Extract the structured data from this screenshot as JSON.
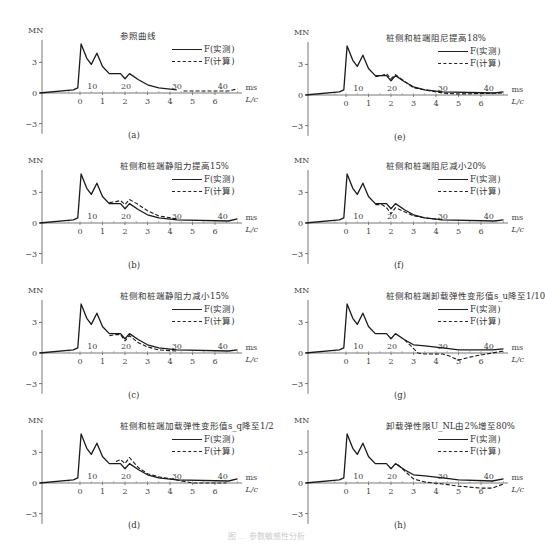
{
  "figure": {
    "caption": "图 … 参数敏感性分析",
    "legend": {
      "measured": "F(实测)",
      "computed": "F(计算)"
    },
    "axis": {
      "y_unit": "MN",
      "x_unit_lc": "L/c",
      "x_unit_ms": "ms"
    }
  },
  "chart_data": [
    {
      "id": "a",
      "panel_label": "(a)",
      "title": "参照曲线",
      "type": "line",
      "xlabel": "L/c",
      "ylabel": "MN",
      "secondary_xlabel": "ms",
      "yticks": [
        3,
        0,
        -3
      ],
      "xticks_lc": [
        0,
        1,
        2,
        3,
        4,
        5,
        6
      ],
      "xticks_ms": [
        10,
        20,
        30,
        40
      ],
      "series": [
        {
          "name": "F(实测)",
          "style": "solid",
          "x": [
            -1.8,
            -0.3,
            -0.1,
            0.05,
            0.3,
            0.5,
            0.75,
            1.0,
            1.3,
            1.6,
            1.8,
            2.0,
            2.2,
            2.6,
            3.0,
            3.5,
            4.3
          ],
          "y": [
            0,
            0.3,
            0.5,
            4.8,
            3.4,
            2.8,
            3.9,
            2.6,
            1.9,
            1.9,
            1.9,
            1.4,
            1.9,
            1.3,
            0.8,
            0.5,
            0.3
          ]
        },
        {
          "name": "F(计算)",
          "style": "dashed",
          "x": [
            4.6,
            6.3,
            6.6,
            7.0
          ],
          "y": [
            0.2,
            0.2,
            0.2,
            0.4
          ]
        }
      ]
    },
    {
      "id": "b",
      "panel_label": "(b)",
      "title": "桩侧和桩端静阻力提高15%",
      "type": "line",
      "xlabel": "L/c",
      "ylabel": "MN",
      "secondary_xlabel": "ms",
      "yticks": [
        3,
        0,
        -3
      ],
      "xticks_lc": [
        0,
        1,
        2,
        3,
        4,
        5,
        6
      ],
      "xticks_ms": [
        10,
        20,
        30,
        40
      ],
      "series": [
        {
          "name": "F(实测)",
          "style": "solid",
          "x": [
            -1.8,
            -0.3,
            -0.1,
            0.05,
            0.3,
            0.5,
            0.75,
            1.0,
            1.3,
            1.6,
            1.8,
            2.0,
            2.2,
            2.6,
            3.0,
            3.5,
            4.3,
            6.6,
            7.0
          ],
          "y": [
            0,
            0.3,
            0.5,
            4.8,
            3.4,
            2.8,
            3.9,
            2.6,
            1.9,
            1.9,
            1.9,
            1.4,
            1.9,
            1.3,
            0.8,
            0.5,
            0.3,
            0.2,
            0.4
          ]
        },
        {
          "name": "F(计算)",
          "style": "dashed",
          "x": [
            1.3,
            1.6,
            1.8,
            2.0,
            2.2,
            2.6,
            3.0,
            3.5,
            4.3
          ],
          "y": [
            2.0,
            2.1,
            2.2,
            1.8,
            2.3,
            1.8,
            1.2,
            0.7,
            0.4
          ]
        }
      ]
    },
    {
      "id": "c",
      "panel_label": "(c)",
      "title": "桩侧和桩端静阻力减小15%",
      "type": "line",
      "xlabel": "L/c",
      "ylabel": "MN",
      "secondary_xlabel": "ms",
      "yticks": [
        3,
        0,
        -3
      ],
      "xticks_lc": [
        0,
        1,
        2,
        3,
        4,
        5,
        6
      ],
      "xticks_ms": [
        10,
        20,
        30,
        40
      ],
      "series": [
        {
          "name": "F(实测)",
          "style": "solid",
          "x": [
            -1.8,
            -0.3,
            -0.1,
            0.05,
            0.3,
            0.5,
            0.75,
            1.0,
            1.3,
            1.6,
            1.8,
            2.0,
            2.2,
            2.6,
            3.0,
            3.5,
            4.3,
            6.6,
            7.0
          ],
          "y": [
            0,
            0.3,
            0.5,
            4.8,
            3.4,
            2.8,
            3.9,
            2.6,
            1.9,
            1.9,
            1.9,
            1.4,
            1.9,
            1.3,
            0.8,
            0.5,
            0.3,
            0.2,
            0.3
          ]
        },
        {
          "name": "F(计算)",
          "style": "dashed",
          "x": [
            1.3,
            1.6,
            1.8,
            2.0,
            2.2,
            2.6,
            3.0,
            3.5,
            4.3
          ],
          "y": [
            1.7,
            1.8,
            1.8,
            1.2,
            1.7,
            1.0,
            0.6,
            0.3,
            0.2
          ]
        }
      ]
    },
    {
      "id": "d",
      "panel_label": "(d)",
      "title": "桩侧和桩端加载弹性变形值s_q降至1/2",
      "type": "line",
      "xlabel": "L/c",
      "ylabel": "MN",
      "secondary_xlabel": "ms",
      "yticks": [
        3,
        0,
        -3
      ],
      "xticks_lc": [
        0,
        1,
        2,
        3,
        4,
        5,
        6
      ],
      "xticks_ms": [
        10,
        20,
        30,
        40
      ],
      "series": [
        {
          "name": "F(实测)",
          "style": "solid",
          "x": [
            -1.8,
            -0.3,
            -0.1,
            0.05,
            0.3,
            0.5,
            0.75,
            1.0,
            1.3,
            1.6,
            1.8,
            2.0,
            2.2,
            2.6,
            3.0,
            3.5,
            4.3,
            6.6,
            7.0
          ],
          "y": [
            0,
            0.3,
            0.5,
            4.8,
            3.4,
            2.8,
            3.9,
            2.6,
            1.9,
            1.9,
            1.9,
            1.4,
            1.9,
            1.3,
            0.8,
            0.5,
            0.3,
            0.2,
            0.4
          ]
        },
        {
          "name": "F(计算)",
          "style": "dashed",
          "x": [
            1.6,
            1.8,
            2.0,
            2.2,
            2.6,
            3.0,
            3.5,
            4.3,
            5.0,
            6.5
          ],
          "y": [
            2.1,
            2.3,
            1.9,
            2.5,
            1.5,
            0.9,
            0.6,
            0.3,
            0.0,
            0.0
          ]
        }
      ]
    },
    {
      "id": "e",
      "panel_label": "(e)",
      "title": "桩侧和桩端阻尼提高18%",
      "type": "line",
      "xlabel": "L/c",
      "ylabel": "MN",
      "secondary_xlabel": "ms",
      "yticks": [
        3,
        0,
        -3
      ],
      "xticks_lc": [
        0,
        1,
        2,
        3,
        4,
        5,
        6
      ],
      "xticks_ms": [
        10,
        20,
        30,
        40
      ],
      "series": [
        {
          "name": "F(实测)",
          "style": "solid",
          "x": [
            -1.8,
            -0.3,
            -0.1,
            0.05,
            0.3,
            0.5,
            0.75,
            1.0,
            1.3,
            1.6,
            1.8,
            2.0,
            2.2,
            2.6,
            3.0,
            3.5,
            4.3,
            6.6,
            7.0
          ],
          "y": [
            0,
            0.3,
            0.5,
            4.8,
            3.4,
            2.8,
            3.9,
            2.6,
            1.9,
            1.9,
            1.9,
            1.4,
            1.9,
            1.3,
            0.8,
            0.5,
            0.3,
            0.2,
            0.3
          ]
        },
        {
          "name": "F(计算)",
          "style": "dashed",
          "x": [
            1.3,
            1.6,
            1.8,
            2.0,
            2.2,
            2.5,
            3.0,
            3.5,
            4.3,
            5.0,
            7.0
          ],
          "y": [
            1.8,
            1.9,
            2.1,
            1.6,
            2.0,
            1.5,
            0.7,
            0.5,
            0.2,
            0.1,
            0.2
          ]
        }
      ]
    },
    {
      "id": "f",
      "panel_label": "(f)",
      "title": "桩侧和桩端阻尼减小20%",
      "type": "line",
      "xlabel": "L/c",
      "ylabel": "MN",
      "secondary_xlabel": "ms",
      "yticks": [
        3,
        0,
        -3
      ],
      "xticks_lc": [
        0,
        1,
        2,
        3,
        4,
        5,
        6
      ],
      "xticks_ms": [
        10,
        20,
        30,
        40
      ],
      "series": [
        {
          "name": "F(实测)",
          "style": "solid",
          "x": [
            -1.8,
            -0.3,
            -0.1,
            0.05,
            0.3,
            0.5,
            0.75,
            1.0,
            1.3,
            1.6,
            1.8,
            2.0,
            2.2,
            2.6,
            3.0,
            3.5,
            4.3,
            6.6,
            7.0
          ],
          "y": [
            0,
            0.3,
            0.5,
            4.8,
            3.4,
            2.8,
            3.9,
            2.6,
            1.9,
            1.9,
            1.9,
            1.4,
            1.9,
            1.3,
            0.8,
            0.5,
            0.3,
            0.2,
            0.3
          ]
        },
        {
          "name": "F(计算)",
          "style": "dashed",
          "x": [
            1.3,
            1.6,
            1.8,
            2.0,
            2.2,
            2.6,
            3.0,
            3.5,
            4.3
          ],
          "y": [
            1.8,
            1.8,
            1.5,
            0.9,
            1.5,
            1.1,
            0.7,
            0.5,
            0.3
          ]
        }
      ]
    },
    {
      "id": "g",
      "panel_label": "(g)",
      "title": "桩侧和桩端卸载弹性变形值s_u降至1/10",
      "type": "line",
      "xlabel": "L/c",
      "ylabel": "MN",
      "secondary_xlabel": "ms",
      "yticks": [
        3,
        0,
        -3
      ],
      "xticks_lc": [
        0,
        1,
        2,
        3,
        4,
        5,
        6
      ],
      "xticks_ms": [
        10,
        20,
        30,
        40
      ],
      "series": [
        {
          "name": "F(实测)",
          "style": "solid",
          "x": [
            -1.8,
            -0.3,
            -0.1,
            0.05,
            0.3,
            0.5,
            0.75,
            1.0,
            1.3,
            1.6,
            1.8,
            2.0,
            2.2,
            2.6,
            3.0,
            3.5,
            4.3,
            5.0,
            6.5,
            7.0
          ],
          "y": [
            0,
            0.3,
            0.5,
            4.8,
            3.4,
            2.8,
            3.9,
            2.6,
            1.9,
            1.9,
            1.9,
            1.4,
            1.9,
            1.3,
            0.8,
            0.7,
            0.5,
            0.3,
            0.3,
            0.4
          ]
        },
        {
          "name": "F(计算)",
          "style": "dashed",
          "x": [
            2.6,
            3.2,
            3.5,
            4.3,
            4.6,
            5.0,
            5.5,
            6.0,
            6.5,
            7.0
          ],
          "y": [
            1.3,
            0.0,
            -0.1,
            -0.1,
            -0.3,
            -0.7,
            -0.4,
            -0.2,
            0.0,
            0.2
          ]
        }
      ]
    },
    {
      "id": "h",
      "panel_label": "(h)",
      "title": "卸载弹性限U_NL由2%增至80%",
      "type": "line",
      "xlabel": "L/c",
      "ylabel": "MN",
      "secondary_xlabel": "ms",
      "yticks": [
        3,
        0,
        -3
      ],
      "xticks_lc": [
        0,
        1,
        2,
        3,
        4,
        5,
        6
      ],
      "xticks_ms": [
        10,
        20,
        30,
        40
      ],
      "series": [
        {
          "name": "F(实测)",
          "style": "solid",
          "x": [
            -1.8,
            -0.3,
            -0.1,
            0.05,
            0.3,
            0.5,
            0.75,
            1.0,
            1.3,
            1.6,
            1.8,
            2.0,
            2.2,
            2.6,
            3.0,
            3.5,
            4.3,
            5.0,
            6.5,
            7.0
          ],
          "y": [
            0,
            0.3,
            0.5,
            4.8,
            3.4,
            2.8,
            3.9,
            2.6,
            1.9,
            1.9,
            1.9,
            1.4,
            1.9,
            1.3,
            0.8,
            0.7,
            0.5,
            0.3,
            0.2,
            0.4
          ]
        },
        {
          "name": "F(计算)",
          "style": "dashed",
          "x": [
            2.3,
            2.6,
            3.0,
            3.5,
            4.3,
            5.0,
            6.0,
            6.5,
            7.0
          ],
          "y": [
            1.8,
            1.2,
            0.4,
            0.1,
            -0.1,
            -0.3,
            -0.5,
            -0.5,
            -0.1
          ]
        }
      ]
    }
  ]
}
